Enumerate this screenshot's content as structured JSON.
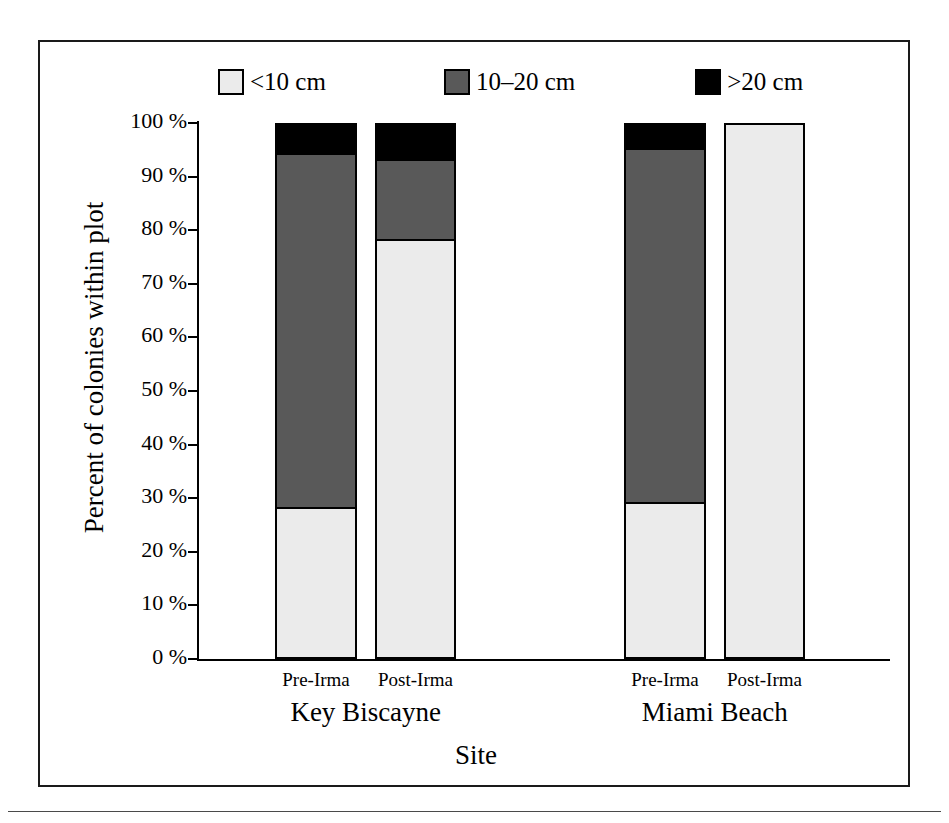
{
  "figure": {
    "y_axis_title": "Percent of colonies within plot",
    "x_axis_title": "Site"
  },
  "legend": {
    "items": [
      {
        "label": "<10 cm",
        "color": "#ebebeb",
        "name": "legend-lt10cm"
      },
      {
        "label": "10–20 cm",
        "color": "#595959",
        "name": "legend-10to20cm"
      },
      {
        "label": ">20 cm",
        "color": "#000000",
        "name": "legend-gt20cm"
      }
    ]
  },
  "y_axis": {
    "ticks": [
      "100 %",
      "90 %",
      "80 %",
      "70 %",
      "60 %",
      "50 %",
      "40 %",
      "30 %",
      "20 %",
      "10 %",
      "0 %"
    ]
  },
  "x_axis": {
    "groups": [
      {
        "label": "Key Biscayne",
        "ticks": [
          "Pre-Irma",
          "Post-Irma"
        ]
      },
      {
        "label": "Miami Beach",
        "ticks": [
          "Pre-Irma",
          "Post-Irma"
        ]
      }
    ]
  },
  "chart_data": {
    "type": "bar",
    "subtype": "stacked-100-percent",
    "title": "",
    "xlabel": "Site",
    "ylabel": "Percent of colonies within plot",
    "ylim": [
      0,
      100
    ],
    "ytick_step": 10,
    "grid": false,
    "legend_position": "top",
    "categories": [
      "Key Biscayne Pre-Irma",
      "Key Biscayne Post-Irma",
      "Miami Beach Pre-Irma",
      "Miami Beach Post-Irma"
    ],
    "groups": [
      "Key Biscayne",
      "Miami Beach"
    ],
    "series": [
      {
        "name": "<10 cm",
        "color": "#ebebeb",
        "values": [
          28,
          78,
          29,
          100
        ]
      },
      {
        "name": "10–20 cm",
        "color": "#595959",
        "values": [
          66,
          15,
          66,
          0
        ]
      },
      {
        "name": ">20 cm",
        "color": "#000000",
        "values": [
          6,
          7,
          5,
          0
        ]
      }
    ],
    "cumulative_tops": {
      "lt10cm": [
        28,
        78,
        29,
        100
      ],
      "lt20cm": [
        94,
        93,
        95,
        100
      ],
      "total": [
        100,
        100,
        100,
        100
      ]
    }
  },
  "bars": [
    {
      "name": "bar-key-biscayne-pre-irma",
      "left": 235,
      "width": 82,
      "segments": [
        {
          "name": "segment-gt20cm",
          "color": "#000000",
          "percent": 6
        },
        {
          "name": "segment-10to20cm",
          "color": "#595959",
          "percent": 66
        },
        {
          "name": "segment-lt10cm",
          "color": "#ebebeb",
          "percent": 28
        }
      ]
    },
    {
      "name": "bar-key-biscayne-post-irma",
      "left": 335,
      "width": 81,
      "segments": [
        {
          "name": "segment-gt20cm",
          "color": "#000000",
          "percent": 7
        },
        {
          "name": "segment-10to20cm",
          "color": "#595959",
          "percent": 15
        },
        {
          "name": "segment-lt10cm",
          "color": "#ebebeb",
          "percent": 78
        }
      ]
    },
    {
      "name": "bar-miami-beach-pre-irma",
      "left": 584,
      "width": 82,
      "segments": [
        {
          "name": "segment-gt20cm",
          "color": "#000000",
          "percent": 5
        },
        {
          "name": "segment-10to20cm",
          "color": "#595959",
          "percent": 66
        },
        {
          "name": "segment-lt10cm",
          "color": "#ebebeb",
          "percent": 29
        }
      ]
    },
    {
      "name": "bar-miami-beach-post-irma",
      "left": 684,
      "width": 81,
      "segments": [
        {
          "name": "segment-lt10cm",
          "color": "#ebebeb",
          "percent": 100
        }
      ]
    }
  ]
}
